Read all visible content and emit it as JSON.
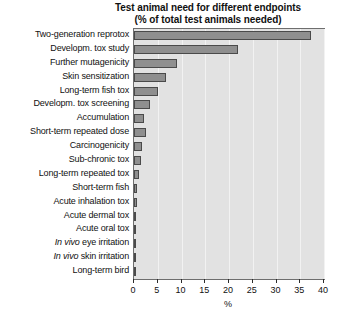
{
  "chart_data": {
    "type": "bar",
    "orientation": "horizontal",
    "title": "Test animal need for different endpoints",
    "subtitle": "(% of total test animals needed)",
    "xlabel": "%",
    "ylabel": "",
    "xlim": [
      0,
      40
    ],
    "xticks": [
      0,
      5,
      10,
      15,
      20,
      25,
      30,
      35,
      40
    ],
    "grid": true,
    "legend": "none",
    "bar_color": "#8f8f8f",
    "bar_edge_color": "#4a4a4a",
    "plot_background": "#e2e2e2",
    "categories": [
      "Two-generation reprotox",
      "Developm. tox study",
      "Further mutagenicity",
      "Skin sensitization",
      "Long-term fish tox",
      "Developm. tox screening",
      "Accumulation",
      "Short-term repeated dose",
      "Carcinogenicity",
      "Sub-chronic tox",
      "Long-term repeated tox",
      "Short-term fish",
      "Acute inhalation tox",
      "Acute dermal tox",
      "Acute oral tox",
      "In vivo eye irritation",
      "In vivo skin irritation",
      "Long-term bird"
    ],
    "categories_rich": [
      {
        "pre": "",
        "ital": "",
        "post": "Two-generation reprotox"
      },
      {
        "pre": "",
        "ital": "",
        "post": "Developm. tox study"
      },
      {
        "pre": "",
        "ital": "",
        "post": "Further mutagenicity"
      },
      {
        "pre": "",
        "ital": "",
        "post": "Skin sensitization"
      },
      {
        "pre": "",
        "ital": "",
        "post": "Long-term fish tox"
      },
      {
        "pre": "",
        "ital": "",
        "post": "Developm. tox screening"
      },
      {
        "pre": "",
        "ital": "",
        "post": "Accumulation"
      },
      {
        "pre": "",
        "ital": "",
        "post": "Short-term repeated dose"
      },
      {
        "pre": "",
        "ital": "",
        "post": "Carcinogenicity"
      },
      {
        "pre": "",
        "ital": "",
        "post": "Sub-chronic tox"
      },
      {
        "pre": "",
        "ital": "",
        "post": "Long-term repeated tox"
      },
      {
        "pre": "",
        "ital": "",
        "post": "Short-term fish"
      },
      {
        "pre": "",
        "ital": "",
        "post": "Acute inhalation tox"
      },
      {
        "pre": "",
        "ital": "",
        "post": "Acute dermal tox"
      },
      {
        "pre": "",
        "ital": "",
        "post": "Acute oral tox"
      },
      {
        "pre": "",
        "ital": "In vivo",
        "post": " eye irritation"
      },
      {
        "pre": "",
        "ital": "In vivo",
        "post": " skin irritation"
      },
      {
        "pre": "",
        "ital": "",
        "post": "Long-term bird"
      }
    ],
    "values": [
      37.3,
      21.9,
      9.0,
      6.7,
      5.0,
      3.4,
      2.1,
      2.5,
      1.6,
      1.4,
      1.1,
      0.7,
      0.6,
      0.5,
      0.45,
      0.3,
      0.3,
      0.25
    ]
  }
}
